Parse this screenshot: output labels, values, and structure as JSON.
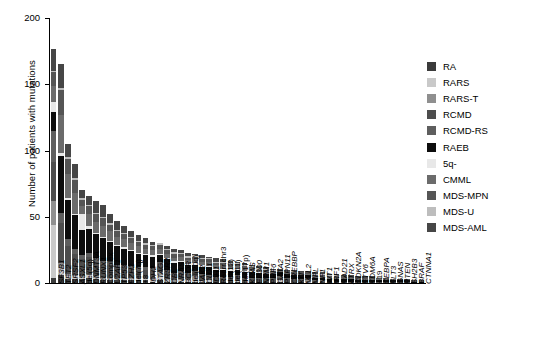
{
  "chart_data": {
    "type": "bar",
    "subtype": "stacked-bar",
    "title": "",
    "xlabel": "",
    "ylabel": "Number of patients with mutations",
    "ylim": [
      0,
      200
    ],
    "yticks": [
      0,
      50,
      100,
      150,
      200
    ],
    "grid": false,
    "legend_position": "right",
    "legend": [
      "RA",
      "RARS",
      "RARS-T",
      "RCMD",
      "RCMD-RS",
      "RAEB",
      "5q-",
      "CMML",
      "MDS-MPN",
      "MDS-U",
      "MDS-AML"
    ],
    "colors": {
      "RA": "#3b3b3b",
      "RARS": "#c9c9c9",
      "RARS-T": "#8f8f8f",
      "RCMD": "#4d4d4d",
      "RCMD-RS": "#5e5e5e",
      "RAEB": "#0d0d0d",
      "5q-": "#e8e8e8",
      "CMML": "#6b6b6b",
      "MDS-MPN": "#555555",
      "MDS-U": "#bdbdbd",
      "MDS-AML": "#464646"
    },
    "categories": [
      "SF3B1",
      "TET2",
      "SRSF2",
      "ASXL1",
      "del(5q)",
      "DNMT3A",
      "RUNX1",
      "Complex",
      "U2AF1",
      "TP53",
      "EZH2",
      "del(7q)",
      "+8",
      "IDH2",
      "STAG2",
      "ZRSR2",
      "CBL",
      "NRAS",
      "BCOR",
      "del(20q)",
      "JAK2",
      "CUX1",
      "IDH1",
      "Rearr.chr3",
      "del(12)",
      "del(11)",
      "del(17p)",
      "KRAS",
      "EP300",
      "NPM1",
      "PHF6",
      "GATA2",
      "PTPN11",
      "CREBBP",
      "KIT",
      "MLL2",
      "MPL",
      "NF1",
      "WT1",
      "IRF1",
      "RAD21",
      "ATRX",
      "CDKN2A",
      "ETV6",
      "KDM6A",
      "+19",
      "CEBPA",
      "FLT3",
      "GNAS",
      "PTEN",
      "SH2B3",
      "BRAF",
      "CTNNA1"
    ],
    "totals": [
      177,
      165,
      105,
      90,
      70,
      66,
      62,
      59,
      52,
      47,
      43,
      39,
      36,
      34,
      31,
      30,
      28,
      26,
      25,
      23,
      22,
      21,
      20,
      19,
      18,
      17,
      16,
      15,
      14,
      13,
      12,
      11,
      11,
      10,
      10,
      9,
      9,
      8,
      8,
      7,
      7,
      6,
      6,
      5,
      5,
      5,
      4,
      4,
      3,
      3,
      3,
      2,
      2
    ],
    "series": [
      {
        "name": "RA",
        "values": [
          4,
          6,
          3,
          3,
          3,
          4,
          3,
          2,
          2,
          2,
          2,
          2,
          2,
          2,
          1,
          2,
          1,
          1,
          1,
          1,
          1,
          1,
          1,
          1,
          1,
          1,
          1,
          1,
          1,
          1,
          1,
          1,
          1,
          1,
          0,
          1,
          0,
          0,
          0,
          0,
          0,
          0,
          0,
          0,
          0,
          0,
          0,
          0,
          0,
          0,
          0,
          0,
          0
        ]
      },
      {
        "name": "RARS",
        "values": [
          40,
          5,
          2,
          2,
          1,
          2,
          1,
          1,
          1,
          1,
          1,
          1,
          1,
          1,
          1,
          4,
          1,
          0,
          1,
          1,
          1,
          1,
          1,
          0,
          0,
          0,
          1,
          0,
          0,
          0,
          0,
          0,
          1,
          0,
          0,
          0,
          1,
          0,
          0,
          0,
          0,
          0,
          0,
          0,
          0,
          0,
          0,
          0,
          0,
          0,
          0,
          0,
          0
        ]
      },
      {
        "name": "RARS-T",
        "values": [
          18,
          4,
          2,
          1,
          1,
          1,
          1,
          1,
          1,
          1,
          1,
          1,
          1,
          1,
          1,
          2,
          1,
          1,
          1,
          1,
          3,
          0,
          0,
          0,
          0,
          0,
          0,
          0,
          0,
          0,
          0,
          0,
          0,
          0,
          0,
          0,
          1,
          0,
          0,
          0,
          0,
          0,
          0,
          0,
          0,
          0,
          0,
          0,
          0,
          0,
          0,
          0,
          0
        ]
      },
      {
        "name": "RCMD",
        "values": [
          29,
          30,
          21,
          16,
          13,
          13,
          11,
          10,
          10,
          8,
          8,
          7,
          6,
          6,
          6,
          5,
          5,
          4,
          4,
          4,
          3,
          4,
          3,
          3,
          3,
          3,
          3,
          2,
          2,
          2,
          2,
          2,
          2,
          2,
          2,
          1,
          1,
          1,
          1,
          1,
          1,
          1,
          1,
          1,
          1,
          1,
          1,
          1,
          1,
          1,
          1,
          0,
          0
        ]
      },
      {
        "name": "RCMD-RS",
        "values": [
          24,
          8,
          5,
          4,
          3,
          3,
          3,
          3,
          3,
          2,
          2,
          2,
          2,
          2,
          2,
          3,
          2,
          2,
          2,
          1,
          1,
          1,
          1,
          1,
          1,
          1,
          1,
          1,
          1,
          1,
          1,
          1,
          1,
          1,
          1,
          1,
          1,
          1,
          1,
          0,
          0,
          0,
          0,
          0,
          0,
          0,
          0,
          0,
          0,
          0,
          0,
          0,
          0
        ]
      },
      {
        "name": "RAEB",
        "values": [
          14,
          43,
          30,
          25,
          19,
          18,
          18,
          17,
          14,
          14,
          12,
          11,
          10,
          9,
          9,
          5,
          8,
          8,
          7,
          6,
          5,
          6,
          6,
          5,
          5,
          5,
          4,
          4,
          4,
          4,
          3,
          3,
          3,
          3,
          3,
          3,
          2,
          2,
          2,
          2,
          2,
          2,
          2,
          1,
          1,
          1,
          1,
          1,
          1,
          1,
          1,
          1,
          1
        ]
      },
      {
        "name": "5q-",
        "values": [
          8,
          2,
          1,
          1,
          12,
          2,
          1,
          1,
          1,
          1,
          1,
          1,
          1,
          1,
          1,
          1,
          1,
          1,
          1,
          1,
          1,
          1,
          1,
          1,
          1,
          1,
          1,
          1,
          1,
          1,
          0,
          0,
          0,
          0,
          0,
          0,
          0,
          0,
          0,
          0,
          0,
          0,
          0,
          0,
          0,
          0,
          0,
          0,
          0,
          0,
          0,
          0,
          0
        ]
      },
      {
        "name": "CMML",
        "values": [
          12,
          29,
          18,
          16,
          6,
          9,
          8,
          8,
          7,
          6,
          6,
          5,
          5,
          4,
          4,
          4,
          3,
          3,
          3,
          3,
          3,
          3,
          3,
          3,
          3,
          2,
          2,
          2,
          2,
          1,
          2,
          1,
          1,
          1,
          1,
          1,
          1,
          1,
          1,
          1,
          1,
          1,
          1,
          1,
          1,
          1,
          1,
          1,
          1,
          0,
          0,
          0,
          0
        ]
      },
      {
        "name": "MDS-MPN",
        "values": [
          10,
          19,
          12,
          10,
          5,
          6,
          6,
          6,
          5,
          4,
          4,
          4,
          3,
          3,
          3,
          3,
          3,
          3,
          2,
          2,
          2,
          2,
          2,
          2,
          2,
          2,
          1,
          2,
          1,
          1,
          1,
          1,
          1,
          1,
          1,
          1,
          1,
          1,
          1,
          1,
          1,
          1,
          1,
          1,
          1,
          1,
          1,
          1,
          0,
          1,
          1,
          1,
          1
        ]
      },
      {
        "name": "MDS-U",
        "values": [
          1,
          1,
          1,
          1,
          1,
          1,
          1,
          1,
          1,
          1,
          1,
          1,
          1,
          1,
          1,
          1,
          1,
          1,
          1,
          1,
          1,
          1,
          1,
          1,
          1,
          1,
          1,
          1,
          1,
          1,
          1,
          1,
          0,
          0,
          1,
          0,
          0,
          1,
          1,
          1,
          1,
          0,
          0,
          0,
          0,
          0,
          0,
          0,
          0,
          0,
          0,
          0,
          0
        ]
      },
      {
        "name": "MDS-AML",
        "values": [
          17,
          18,
          10,
          11,
          6,
          7,
          9,
          9,
          7,
          7,
          5,
          4,
          4,
          4,
          2,
          0,
          2,
          3,
          2,
          3,
          1,
          2,
          1,
          3,
          2,
          2,
          1,
          1,
          1,
          2,
          1,
          1,
          1,
          1,
          1,
          1,
          1,
          1,
          1,
          1,
          1,
          1,
          1,
          1,
          1,
          1,
          0,
          0,
          0,
          0,
          0,
          0,
          0
        ]
      }
    ]
  }
}
